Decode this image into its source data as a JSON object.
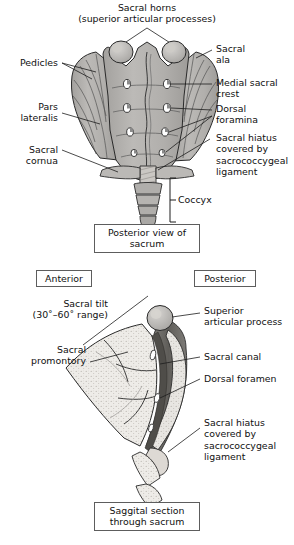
{
  "figure": {
    "title_top": "Sacral horns\n(superior articular processes)",
    "panel1": {
      "caption": "Posterior view of\nsacrum",
      "labels_left": [
        {
          "id": "pedicles",
          "text": "Pedicles"
        },
        {
          "id": "pars-lateralis",
          "text": "Pars\nlateralis"
        },
        {
          "id": "sacral-cornua",
          "text": "Sacral cornua"
        }
      ],
      "labels_right": [
        {
          "id": "sacral-ala",
          "text": "Sacral\nala"
        },
        {
          "id": "medial-sacral-crest",
          "text": "Medial sacral\ncrest"
        },
        {
          "id": "dorsal-foramina",
          "text": "Dorsal\nforamina"
        },
        {
          "id": "sacral-hiatus",
          "text": "Sacral hiatus\ncovered by\nsacrococcygeal\nligament"
        }
      ],
      "bracket_label": "Coccyx"
    },
    "panel2": {
      "caption": "Saggital section\nthrough sacrum",
      "orientation_left": "Anterior",
      "orientation_right": "Posterior",
      "labels_left": [
        {
          "id": "sacral-tilt",
          "text": "Sacral tilt\n(30˚–60˚ range)"
        },
        {
          "id": "sacral-promontory",
          "text": "Sacral\npromontory"
        }
      ],
      "labels_right": [
        {
          "id": "superior-articular-process",
          "text": "Superior\narticular process"
        },
        {
          "id": "sacral-canal",
          "text": "Sacral canal"
        },
        {
          "id": "dorsal-foramen",
          "text": "Dorsal foramen"
        },
        {
          "id": "sacral-hiatus-2",
          "text": "Sacral hiatus\ncovered by\nsacrococcygeal\nligament"
        }
      ]
    },
    "colors": {
      "bone_fill": "#b3b3b3",
      "bone_fill_light": "#e9e7e4",
      "canal_dark": "#6f6f6f",
      "outline": "#2a2a2a",
      "leader": "#1d1d1d",
      "box_border": "#5d5d5d"
    }
  }
}
